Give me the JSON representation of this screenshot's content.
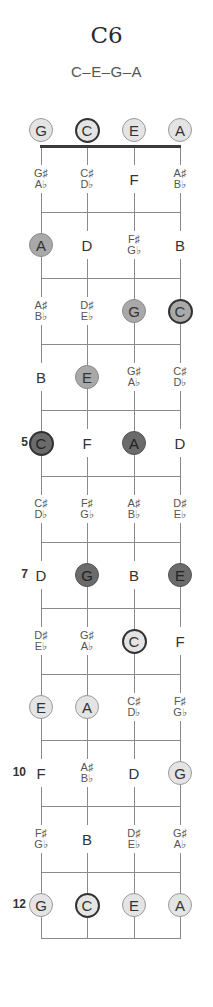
{
  "header": {
    "title": "C6",
    "subtitle": "C–E–G–A"
  },
  "layout": {
    "string_x": [
      41,
      87,
      134,
      180
    ],
    "nut_y": 146,
    "fret_spacing": 66,
    "open_y": 130
  },
  "colors": {
    "light": "#e4e4e4",
    "medium": "#a9a9a9",
    "dark": "#6b6b6b",
    "root_border": "#333333",
    "line": "#8a8a8a"
  },
  "open_strings": [
    {
      "string": 0,
      "note": "G",
      "shade": "light",
      "root": false
    },
    {
      "string": 1,
      "note": "C",
      "shade": "light",
      "root": true
    },
    {
      "string": 2,
      "note": "E",
      "shade": "light",
      "root": false
    },
    {
      "string": 3,
      "note": "A",
      "shade": "light",
      "root": false
    }
  ],
  "fret_numbers": [
    {
      "fret": 5,
      "label": "5"
    },
    {
      "fret": 7,
      "label": "7"
    },
    {
      "fret": 10,
      "label": "10"
    },
    {
      "fret": 12,
      "label": "12"
    }
  ],
  "frets": [
    {
      "fret": 1,
      "cells": [
        {
          "note": "G♯/A♭",
          "sharp": "G♯",
          "flat": "A♭"
        },
        {
          "note": "C♯/D♭",
          "sharp": "C♯",
          "flat": "D♭"
        },
        {
          "note": "F"
        },
        {
          "note": "A♯/B♭",
          "sharp": "A♯",
          "flat": "B♭"
        }
      ]
    },
    {
      "fret": 2,
      "cells": [
        {
          "note": "A",
          "shade": "medium"
        },
        {
          "note": "D"
        },
        {
          "note": "F♯/G♭",
          "sharp": "F♯",
          "flat": "G♭"
        },
        {
          "note": "B"
        }
      ]
    },
    {
      "fret": 3,
      "cells": [
        {
          "note": "A♯/B♭",
          "sharp": "A♯",
          "flat": "B♭"
        },
        {
          "note": "D♯/E♭",
          "sharp": "D♯",
          "flat": "E♭"
        },
        {
          "note": "G",
          "shade": "medium"
        },
        {
          "note": "C",
          "shade": "medium",
          "root": true
        }
      ]
    },
    {
      "fret": 4,
      "cells": [
        {
          "note": "B"
        },
        {
          "note": "E",
          "shade": "medium"
        },
        {
          "note": "G♯/A♭",
          "sharp": "G♯",
          "flat": "A♭"
        },
        {
          "note": "C♯/D♭",
          "sharp": "C♯",
          "flat": "D♭"
        }
      ]
    },
    {
      "fret": 5,
      "cells": [
        {
          "note": "C",
          "shade": "dark",
          "root": true
        },
        {
          "note": "F"
        },
        {
          "note": "A",
          "shade": "dark"
        },
        {
          "note": "D"
        }
      ]
    },
    {
      "fret": 6,
      "cells": [
        {
          "note": "C♯/D♭",
          "sharp": "C♯",
          "flat": "D♭"
        },
        {
          "note": "F♯/G♭",
          "sharp": "F♯",
          "flat": "G♭"
        },
        {
          "note": "A♯/B♭",
          "sharp": "A♯",
          "flat": "B♭"
        },
        {
          "note": "D♯/E♭",
          "sharp": "D♯",
          "flat": "E♭"
        }
      ]
    },
    {
      "fret": 7,
      "cells": [
        {
          "note": "D"
        },
        {
          "note": "G",
          "shade": "dark"
        },
        {
          "note": "B"
        },
        {
          "note": "E",
          "shade": "dark"
        }
      ]
    },
    {
      "fret": 8,
      "cells": [
        {
          "note": "D♯/E♭",
          "sharp": "D♯",
          "flat": "E♭"
        },
        {
          "note": "G♯/A♭",
          "sharp": "G♯",
          "flat": "A♭"
        },
        {
          "note": "C",
          "shade": "light",
          "root": true
        },
        {
          "note": "F"
        }
      ]
    },
    {
      "fret": 9,
      "cells": [
        {
          "note": "E",
          "shade": "light"
        },
        {
          "note": "A",
          "shade": "light"
        },
        {
          "note": "C♯/D♭",
          "sharp": "C♯",
          "flat": "D♭"
        },
        {
          "note": "F♯/G♭",
          "sharp": "F♯",
          "flat": "G♭"
        }
      ]
    },
    {
      "fret": 10,
      "cells": [
        {
          "note": "F"
        },
        {
          "note": "A♯/B♭",
          "sharp": "A♯",
          "flat": "B♭"
        },
        {
          "note": "D"
        },
        {
          "note": "G",
          "shade": "light"
        }
      ]
    },
    {
      "fret": 11,
      "cells": [
        {
          "note": "F♯/G♭",
          "sharp": "F♯",
          "flat": "G♭"
        },
        {
          "note": "B"
        },
        {
          "note": "D♯/E♭",
          "sharp": "D♯",
          "flat": "E♭"
        },
        {
          "note": "G♯/A♭",
          "sharp": "G♯",
          "flat": "A♭"
        }
      ]
    },
    {
      "fret": 12,
      "cells": [
        {
          "note": "G",
          "shade": "light"
        },
        {
          "note": "C",
          "shade": "light",
          "root": true
        },
        {
          "note": "E",
          "shade": "light"
        },
        {
          "note": "A",
          "shade": "light"
        }
      ]
    }
  ]
}
